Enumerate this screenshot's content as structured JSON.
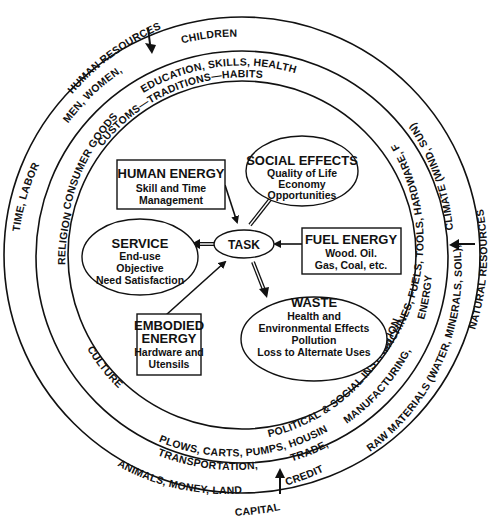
{
  "diagram": {
    "center": {
      "label": "TASK"
    },
    "nodes": [
      {
        "id": "human-energy",
        "shape": "box",
        "title": [
          "HUMAN ENERGY"
        ],
        "lines": [
          "Skill and Time",
          "Management"
        ],
        "relation": "input"
      },
      {
        "id": "social-effects",
        "shape": "ellipse",
        "title": [
          "SOCIAL EFFECTS"
        ],
        "lines": [
          "Quality of Life",
          "Economy",
          "Opportunities"
        ],
        "relation": "output"
      },
      {
        "id": "service",
        "shape": "ellipse",
        "title": [
          "SERVICE"
        ],
        "lines": [
          "End-use",
          "Objective",
          "Need Satisfaction"
        ],
        "relation": "output"
      },
      {
        "id": "fuel-energy",
        "shape": "box",
        "title": [
          "FUEL ENERGY"
        ],
        "lines": [
          "Wood. Oil.",
          "Gas, Coal, etc."
        ],
        "relation": "input"
      },
      {
        "id": "embodied-energy",
        "shape": "box",
        "title": [
          "EMBODIED",
          "ENERGY"
        ],
        "lines": [
          "Hardware and",
          "Utensils"
        ],
        "relation": "input"
      },
      {
        "id": "waste",
        "shape": "ellipse",
        "title": [
          "WASTE"
        ],
        "lines": [
          "Health and",
          "Environmental Effects",
          "Pollution",
          "Loss to Alternate Uses"
        ],
        "relation": "output"
      }
    ],
    "rings": {
      "inner_band": {
        "culture_labels": [
          "CUSTOMS—TRADITIONS—HABITS",
          "RELIGION",
          "CULTURE",
          "POLITICAL & SOCIAL INSTITUTIONS"
        ]
      },
      "middle_band": {
        "labels": [
          "EDUCATION, SKILLS, HEALTH",
          "CONSUMER GOODS",
          "MACHINES, FUELS, TOOLS, HARDWARE, FOOD",
          "ENERGY",
          "MANUFACTURING,",
          "PLOWS, CARTS, PUMPS, HOUSING",
          "TRANSPORTATION,",
          "TRADE,"
        ]
      },
      "outer_band": {
        "labels": [
          "MEN, WOMEN,",
          "CHILDREN",
          "TIME, LABOR",
          "CLIMATE (WIND, SUN)",
          "RAW MATERIALS (WATER, MINERALS, SOIL),",
          "ANIMALS, MONEY, LAND",
          "CREDIT"
        ]
      },
      "outside": {
        "human_resources": "HUMAN RESOURCES",
        "natural_resources": "NATURAL RESOURCES",
        "capital": "CAPITAL"
      }
    }
  }
}
